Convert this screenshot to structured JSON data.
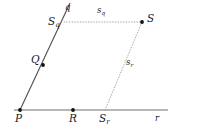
{
  "figure": {
    "type": "geometry-diagram",
    "background_color": "#ffffff",
    "stroke_color": "#4d4d4d",
    "dotted_color": "#9a9a9a",
    "point_color": "#111111",
    "label_color": "#1a1a1a",
    "lines": [
      {
        "name": "q",
        "label": "q",
        "style": "solid",
        "x1": 20,
        "y1": 110,
        "x2": 70,
        "y2": 3
      },
      {
        "name": "r",
        "label": "r",
        "style": "solid",
        "x1": 14,
        "y1": 110,
        "x2": 168,
        "y2": 110
      }
    ],
    "segments": [
      {
        "name": "s_q",
        "label_base": "s",
        "label_sub": "q",
        "style": "dotted",
        "x1": 64,
        "y1": 22,
        "x2": 142,
        "y2": 22
      },
      {
        "name": "s_r",
        "label_base": "s",
        "label_sub": "r",
        "style": "dotted",
        "x1": 105,
        "y1": 110,
        "x2": 142,
        "y2": 22
      }
    ],
    "points": [
      {
        "name": "P",
        "label_base": "P",
        "label_sub": "",
        "x": 20,
        "y": 110,
        "dot": true
      },
      {
        "name": "Q",
        "label_base": "Q",
        "label_sub": "",
        "x": 43,
        "y": 65,
        "dot": true
      },
      {
        "name": "R",
        "label_base": "R",
        "label_sub": "",
        "x": 73,
        "y": 110,
        "dot": true
      },
      {
        "name": "S_q",
        "label_base": "S",
        "label_sub": "q",
        "x": 64,
        "y": 22,
        "dot": false
      },
      {
        "name": "S_r",
        "label_base": "S",
        "label_sub": "r",
        "x": 105,
        "y": 110,
        "dot": false
      },
      {
        "name": "S",
        "label_base": "S",
        "label_sub": "",
        "x": 142,
        "y": 22,
        "dot": true
      }
    ],
    "labels": {
      "q": "q",
      "r": "r",
      "P": "P",
      "Q": "Q",
      "R": "R",
      "S": "S",
      "S_base": "S",
      "s_base": "s",
      "sub_q": "q",
      "sub_r": "r"
    }
  }
}
